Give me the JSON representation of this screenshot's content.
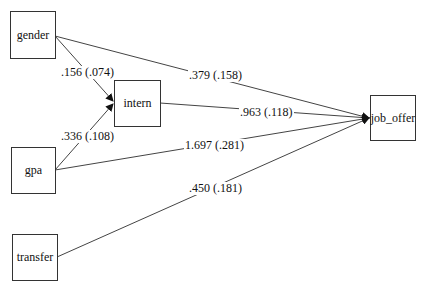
{
  "diagram": {
    "type": "path-diagram",
    "nodes": [
      {
        "id": "gender",
        "label": "gender"
      },
      {
        "id": "intern",
        "label": "intern"
      },
      {
        "id": "gpa",
        "label": "gpa"
      },
      {
        "id": "transfer",
        "label": "transfer"
      },
      {
        "id": "job_offer",
        "label": "job_offer"
      }
    ],
    "edges": [
      {
        "from": "gender",
        "to": "intern",
        "label": ".156 (.074)"
      },
      {
        "from": "gpa",
        "to": "intern",
        "label": ".336 (.108)"
      },
      {
        "from": "gender",
        "to": "job_offer",
        "label": ".379 (.158)"
      },
      {
        "from": "intern",
        "to": "job_offer",
        "label": ".963 (.118)"
      },
      {
        "from": "gpa",
        "to": "job_offer",
        "label": "1.697 (.281)"
      },
      {
        "from": "transfer",
        "to": "job_offer",
        "label": ".450 (.181)"
      }
    ],
    "colors": {
      "line": "#333333",
      "background": "#ffffff"
    }
  }
}
